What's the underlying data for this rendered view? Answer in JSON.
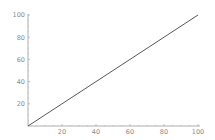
{
  "chart_data": {
    "type": "line",
    "title": "",
    "xlabel": "",
    "ylabel": "",
    "xlim": [
      0,
      100
    ],
    "ylim": [
      0,
      100
    ],
    "grid": false,
    "legend": null,
    "x_ticks": [
      "20",
      "40",
      "60",
      "80",
      "100"
    ],
    "y_ticks": [
      "20",
      "40",
      "60",
      "80",
      "100"
    ],
    "series": [
      {
        "name": "y = x",
        "x": [
          0,
          100
        ],
        "y": [
          0,
          100
        ],
        "color": "#444444"
      }
    ]
  },
  "colors": {
    "axis": "#9a9a9a",
    "line": "#444444",
    "tick_label": "#8a8a8a"
  }
}
